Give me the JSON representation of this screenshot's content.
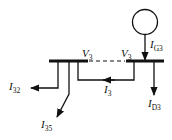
{
  "diagram": {
    "type": "power-system-bus-current-diagram",
    "labels": {
      "v_left": {
        "base": "V",
        "sub": "3"
      },
      "v_right": {
        "base": "V",
        "sub": "3"
      },
      "i_g3": {
        "base": "I",
        "sub": "G3"
      },
      "i_d3": {
        "base": "I",
        "sub": "D3"
      },
      "i_3": {
        "base": "I",
        "sub": "3"
      },
      "i_32": {
        "base": "I",
        "sub": "32"
      },
      "i_35": {
        "base": "I",
        "sub": "35"
      }
    },
    "colors": {
      "line": "#111111",
      "background": "#ffffff"
    }
  }
}
